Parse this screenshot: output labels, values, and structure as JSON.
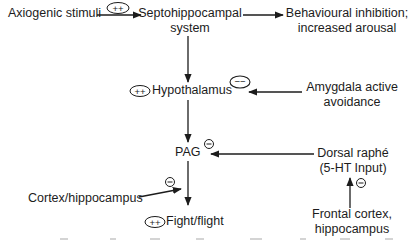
{
  "diagram": {
    "nodes": {
      "axiogenic": {
        "label": "Axiogenic stimuli"
      },
      "septo": {
        "line1": "Septohippocampal",
        "line2": "system"
      },
      "behavioural": {
        "line1": "Behavioural inhibition;",
        "line2": "increased arousal"
      },
      "hypothalamus": {
        "label": "Hypothalamus",
        "badge": "++"
      },
      "amygdala": {
        "line1": "Amygdala active",
        "line2": "avoidance"
      },
      "pag": {
        "label": "PAG",
        "badge": "−"
      },
      "dorsal_raphe": {
        "line1": "Dorsal raphé",
        "line2": "(5-HT Input)"
      },
      "cortex_hippo": {
        "label": "Cortex/hippocampus"
      },
      "fight_flight": {
        "label": "Fight/flight",
        "badge": "++"
      },
      "frontal": {
        "line1": "Frontal cortex,",
        "line2": "hippocampus"
      }
    },
    "edges": [
      {
        "from": "Axiogenic stimuli",
        "to": "Septohippocampal system",
        "sign": "++"
      },
      {
        "from": "Septohippocampal system",
        "to": "Behavioural inhibition; increased arousal",
        "sign": ""
      },
      {
        "from": "Septohippocampal system",
        "to": "Hypothalamus",
        "sign": ""
      },
      {
        "from": "Amygdala active avoidance",
        "to": "Hypothalamus",
        "sign": "−−"
      },
      {
        "from": "Hypothalamus",
        "to": "PAG",
        "sign": ""
      },
      {
        "from": "Dorsal raphé (5-HT Input)",
        "to": "PAG",
        "sign": "−"
      },
      {
        "from": "PAG",
        "to": "Fight/flight",
        "sign": ""
      },
      {
        "from": "Cortex/hippocampus",
        "to": "Fight/flight",
        "sign": "−"
      },
      {
        "from": "Frontal cortex, hippocampus",
        "to": "Dorsal raphé (5-HT Input)",
        "sign": "−"
      }
    ],
    "badges": {
      "axiogenic_edge": "++",
      "amygdala_edge": "−−",
      "pag_inhibit": "−",
      "cortex_inhibit": "−",
      "frontal_inhibit": "−"
    },
    "colors": {
      "ink": "#1c1c1c",
      "background": "#ffffff"
    }
  }
}
